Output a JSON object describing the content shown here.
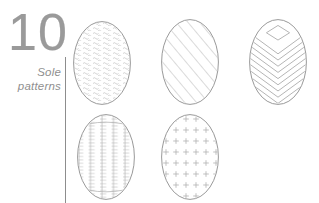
{
  "page": {
    "width": 319,
    "height": 203,
    "background": "#ffffff",
    "outline_color": "#8d8d8d",
    "pattern_color": "#b5b5b5",
    "text_color": "#9a9a9a"
  },
  "index": {
    "number": "10",
    "title_line1": "Sole",
    "title_line2": "patterns",
    "divider_name": "vertical-divider"
  },
  "soles": [
    {
      "id": "sole-1",
      "pattern": "wavy-dash-texture",
      "label": "Wavy dash texture",
      "row": 1,
      "column": 1,
      "x": 73,
      "y": 21,
      "width": 58,
      "height": 84
    },
    {
      "id": "sole-2",
      "pattern": "diagonal-stripes",
      "label": "Diagonal stripes",
      "row": 1,
      "column": 2,
      "x": 161,
      "y": 19,
      "width": 58,
      "height": 86
    },
    {
      "id": "sole-3",
      "pattern": "chevron-with-diamond",
      "label": "Chevron with diamond",
      "row": 1,
      "column": 3,
      "x": 249,
      "y": 19,
      "width": 58,
      "height": 86
    },
    {
      "id": "sole-4",
      "pattern": "vertical-bristle-lines",
      "label": "Vertical bristle lines",
      "row": 2,
      "column": 1,
      "x": 77,
      "y": 114,
      "width": 58,
      "height": 86
    },
    {
      "id": "sole-5",
      "pattern": "plus-sign-grid",
      "label": "Plus sign grid",
      "row": 2,
      "column": 2,
      "x": 161,
      "y": 114,
      "width": 58,
      "height": 86
    }
  ]
}
